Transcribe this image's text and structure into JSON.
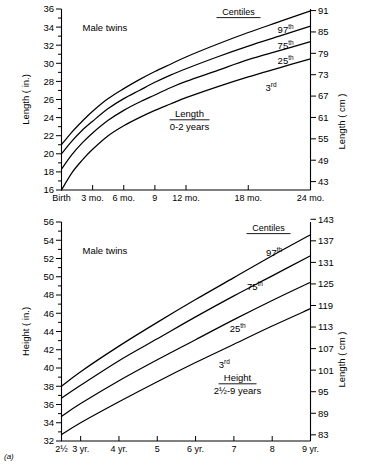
{
  "figure": {
    "panel_label": "(a)",
    "background": "#ffffff",
    "ink": "#000000"
  },
  "chart_data": [
    {
      "type": "line",
      "title": "Length",
      "subtitle": "0-2 years",
      "annotation": "Male twins",
      "legend_title": "Centiles",
      "legend_position": "inside-upper-right",
      "grid": false,
      "xlabel": "",
      "ylabel": "Length ( in.)",
      "y2label": "Length ( cm )",
      "xlim": [
        0,
        24
      ],
      "ylim": [
        16,
        36
      ],
      "y2lim": [
        40.64,
        91.44
      ],
      "x_ticks": [
        0,
        3,
        6,
        9,
        12,
        18,
        24
      ],
      "x_tick_labels": [
        "Birth",
        "3 mo.",
        "6 mo.",
        "9",
        "12 mo.",
        "18 mo.",
        "24 mo."
      ],
      "y_ticks": [
        16,
        17,
        18,
        19,
        20,
        21,
        22,
        23,
        24,
        25,
        26,
        27,
        28,
        29,
        30,
        31,
        32,
        33,
        34,
        35,
        36
      ],
      "y_tick_labels": [
        "16",
        "",
        "18",
        "",
        "20",
        "",
        "22",
        "",
        "24",
        "",
        "26",
        "",
        "28",
        "",
        "30",
        "",
        "32",
        "",
        "34",
        "",
        "36"
      ],
      "y2_ticks": [
        43,
        49,
        55,
        61,
        67,
        73,
        79,
        85,
        91
      ],
      "y2_tick_labels": [
        "43",
        "49",
        "55",
        "61",
        "67",
        "73",
        "79",
        "85",
        "91"
      ],
      "x": [
        0,
        1,
        2,
        3,
        4.5,
        6,
        7.5,
        9,
        10.5,
        12,
        15,
        18,
        21,
        24
      ],
      "series": [
        {
          "name": "97th",
          "label": "97",
          "label_sup": "th",
          "values": [
            21.0,
            22.4,
            23.6,
            24.7,
            26.1,
            27.2,
            28.2,
            29.1,
            29.9,
            30.7,
            32.1,
            33.4,
            34.6,
            35.8
          ]
        },
        {
          "name": "75th",
          "label": "75",
          "label_sup": "th",
          "values": [
            20.0,
            21.4,
            22.6,
            23.6,
            25.0,
            26.1,
            27.0,
            27.9,
            28.7,
            29.4,
            30.7,
            31.9,
            33.0,
            34.1
          ]
        },
        {
          "name": "25th",
          "label": "25",
          "label_sup": "th",
          "values": [
            18.3,
            19.9,
            21.2,
            22.3,
            23.7,
            24.8,
            25.7,
            26.5,
            27.3,
            28.0,
            29.2,
            30.4,
            31.4,
            32.4
          ]
        },
        {
          "name": "3rd",
          "label": "3",
          "label_sup": "rd",
          "values": [
            16.0,
            17.9,
            19.3,
            20.5,
            22.0,
            23.1,
            24.0,
            24.8,
            25.5,
            26.2,
            27.4,
            28.5,
            29.5,
            30.5
          ]
        }
      ]
    },
    {
      "type": "line",
      "title": "Height",
      "subtitle": "2½-9 years",
      "annotation": "Male twins",
      "legend_title": "Centiles",
      "legend_position": "inside-upper-right",
      "grid": false,
      "xlabel": "",
      "ylabel": "Height ( in.)",
      "y2label": "Length ( cm )",
      "xlim": [
        2.5,
        9
      ],
      "ylim": [
        32,
        56
      ],
      "y2lim": [
        81.28,
        142.24
      ],
      "x_ticks": [
        2.5,
        3,
        4,
        5,
        6,
        7,
        8,
        9
      ],
      "x_tick_labels": [
        "2½",
        "3 yr.",
        "4 yr.",
        "5",
        "6 yr.",
        "7",
        "8",
        "9 yr."
      ],
      "y_ticks": [
        32,
        33,
        34,
        35,
        36,
        37,
        38,
        39,
        40,
        41,
        42,
        43,
        44,
        45,
        46,
        47,
        48,
        49,
        50,
        51,
        52,
        53,
        54,
        55,
        56
      ],
      "y_tick_labels": [
        "32",
        "",
        "34",
        "",
        "36",
        "",
        "38",
        "",
        "40",
        "",
        "42",
        "",
        "44",
        "",
        "46",
        "",
        "48",
        "",
        "50",
        "",
        "52",
        "",
        "54",
        "",
        "56"
      ],
      "y2_ticks": [
        83,
        89,
        95,
        101,
        107,
        113,
        119,
        125,
        131,
        137,
        143
      ],
      "y2_tick_labels": [
        "83",
        "89",
        "95",
        "101",
        "107",
        "113",
        "119",
        "125",
        "131",
        "137",
        "143"
      ],
      "x": [
        2.5,
        3,
        4,
        5,
        6,
        7,
        8,
        9
      ],
      "series": [
        {
          "name": "97th",
          "label": "97",
          "label_sup": "th",
          "values": [
            38.0,
            39.6,
            42.4,
            45.0,
            47.5,
            49.9,
            52.3,
            54.6
          ]
        },
        {
          "name": "75th",
          "label": "75",
          "label_sup": "th",
          "values": [
            36.7,
            38.1,
            40.8,
            43.2,
            45.6,
            47.9,
            50.1,
            52.3
          ]
        },
        {
          "name": "25th",
          "label": "25",
          "label_sup": "th",
          "values": [
            34.7,
            36.1,
            38.6,
            40.9,
            43.1,
            45.3,
            47.4,
            49.4
          ]
        },
        {
          "name": "3rd",
          "label": "3",
          "label_sup": "rd",
          "values": [
            32.7,
            34.0,
            36.3,
            38.5,
            40.6,
            42.6,
            44.6,
            46.5
          ]
        }
      ]
    }
  ]
}
